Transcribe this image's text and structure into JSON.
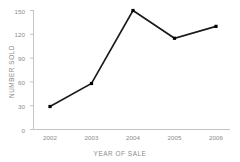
{
  "chart_data": {
    "type": "line",
    "title": "",
    "xlabel": "YEAR OF SALE",
    "ylabel": "NUMBER SOLD",
    "categories": [
      "2002",
      "2003",
      "2004",
      "2005",
      "2006"
    ],
    "values": [
      29,
      58,
      150,
      115,
      130
    ],
    "ylim": [
      0,
      150
    ],
    "yticks": [
      0,
      30,
      60,
      90,
      120,
      150
    ],
    "ytick_labels": [
      "0",
      "30",
      "60",
      "90",
      "120",
      "150"
    ],
    "grid": false,
    "legend": "none",
    "marker": "square",
    "series": [
      {
        "name": "Number sold",
        "values": [
          29,
          58,
          150,
          115,
          130
        ]
      }
    ],
    "colors": {
      "line": "#1a1a1a",
      "marker": "#000000",
      "axis": "#c4c4c4",
      "tick_text": "#8b8b8b",
      "background": "#ffffff"
    }
  }
}
